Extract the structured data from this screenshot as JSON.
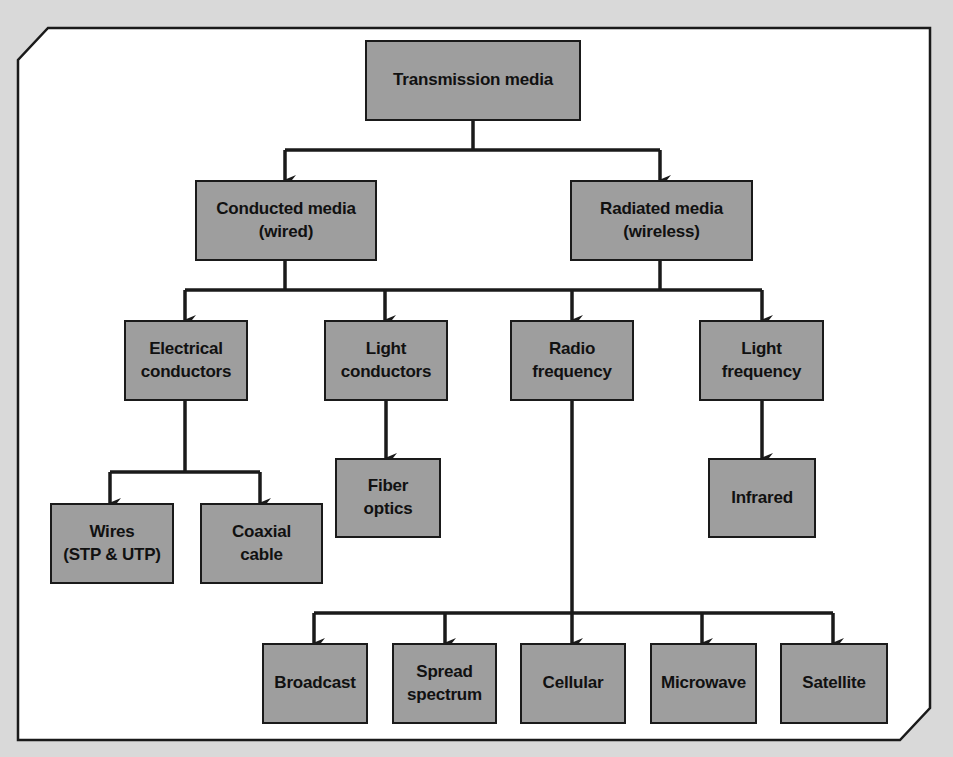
{
  "diagram": {
    "type": "hierarchy-tree",
    "colors": {
      "background": "#d9d9d9",
      "frame_fill": "#ffffff",
      "box_fill": "#9e9e9e",
      "line": "#1a1a1a"
    },
    "nodes": {
      "root": {
        "label": "Transmission media"
      },
      "conducted": {
        "label": "Conducted media\n(wired)"
      },
      "radiated": {
        "label": "Radiated media\n(wireless)"
      },
      "electrical": {
        "label": "Electrical\nconductors"
      },
      "light_conductors": {
        "label": "Light\nconductors"
      },
      "radio": {
        "label": "Radio\nfrequency"
      },
      "light_frequency": {
        "label": "Light\nfrequency"
      },
      "wires": {
        "label": "Wires\n(STP & UTP)"
      },
      "coaxial": {
        "label": "Coaxial\ncable"
      },
      "fiber": {
        "label": "Fiber\noptics"
      },
      "infrared": {
        "label": "Infrared"
      },
      "broadcast": {
        "label": "Broadcast"
      },
      "spread": {
        "label": "Spread\nspectrum"
      },
      "cellular": {
        "label": "Cellular"
      },
      "microwave": {
        "label": "Microwave"
      },
      "satellite": {
        "label": "Satellite"
      }
    },
    "edges": [
      [
        "root",
        "conducted"
      ],
      [
        "root",
        "radiated"
      ],
      [
        "conducted",
        "electrical"
      ],
      [
        "conducted",
        "light_conductors"
      ],
      [
        "radiated",
        "radio"
      ],
      [
        "radiated",
        "light_frequency"
      ],
      [
        "electrical",
        "wires"
      ],
      [
        "electrical",
        "coaxial"
      ],
      [
        "light_conductors",
        "fiber"
      ],
      [
        "light_frequency",
        "infrared"
      ],
      [
        "radio",
        "broadcast"
      ],
      [
        "radio",
        "spread"
      ],
      [
        "radio",
        "cellular"
      ],
      [
        "radio",
        "microwave"
      ],
      [
        "radio",
        "satellite"
      ]
    ]
  }
}
